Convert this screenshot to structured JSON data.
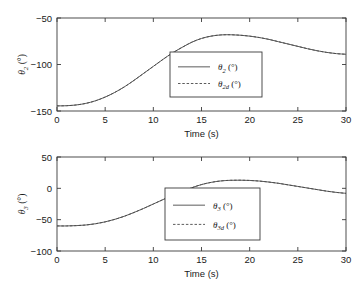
{
  "figure": {
    "background": "#ffffff",
    "line_color": "#4a4a4a",
    "axis_color": "#3a3a3a"
  },
  "chart_data": [
    {
      "id": "theta2-plot",
      "type": "line",
      "title": "",
      "xlabel": "Time (s)",
      "ylabel": "θ₂ (°)",
      "ylabel_base": "θ",
      "ylabel_sub": "2",
      "ylabel_unit": " (°)",
      "xlim": [
        0,
        30
      ],
      "ylim": [
        -150,
        -50
      ],
      "xticks": [
        0,
        5,
        10,
        15,
        20,
        25,
        30
      ],
      "xticklabels": [
        "0",
        "5",
        "10",
        "15",
        "20",
        "25",
        "30"
      ],
      "yticks": [
        -50,
        -100,
        -150
      ],
      "yticklabels": [
        "−50",
        "−100",
        "−150"
      ],
      "grid": false,
      "legend_position": "center",
      "x": [
        0,
        1,
        2,
        3,
        4,
        5,
        6,
        7,
        8,
        9,
        10,
        11,
        12,
        13,
        14,
        15,
        16,
        17,
        18,
        19,
        20,
        21,
        22,
        23,
        24,
        25,
        26,
        27,
        28,
        29,
        30
      ],
      "series": [
        {
          "name": "θ₂ (°)",
          "label_base": "θ",
          "label_sub": "2",
          "label_unit": " (°)",
          "style": "solid",
          "values": [
            -144.5,
            -144.3,
            -143.5,
            -141.8,
            -139.0,
            -135.0,
            -130.0,
            -124.0,
            -117.0,
            -109.5,
            -102.0,
            -94.5,
            -87.5,
            -81.5,
            -76.0,
            -72.0,
            -69.5,
            -68.2,
            -68.0,
            -68.5,
            -69.5,
            -71.0,
            -73.0,
            -75.5,
            -78.0,
            -80.5,
            -83.0,
            -85.2,
            -87.0,
            -88.3,
            -89.0
          ]
        },
        {
          "name": "θ₂ₑ (°)",
          "label_base": "θ",
          "label_sub": "2d",
          "label_unit": " (°)",
          "style": "dashed",
          "values": [
            -144.5,
            -144.3,
            -143.5,
            -141.8,
            -139.0,
            -135.0,
            -130.0,
            -124.0,
            -117.0,
            -109.5,
            -102.0,
            -94.5,
            -87.5,
            -81.5,
            -76.0,
            -72.0,
            -69.5,
            -68.2,
            -68.0,
            -68.5,
            -69.5,
            -71.0,
            -73.0,
            -75.5,
            -78.0,
            -80.5,
            -83.0,
            -85.2,
            -87.0,
            -88.3,
            -89.0
          ]
        }
      ]
    },
    {
      "id": "theta3-plot",
      "type": "line",
      "title": "",
      "xlabel": "Time (s)",
      "ylabel": "θ₃ (°)",
      "ylabel_base": "θ",
      "ylabel_sub": "3",
      "ylabel_unit": " (°)",
      "xlim": [
        0,
        30
      ],
      "ylim": [
        -100,
        50
      ],
      "xticks": [
        0,
        5,
        10,
        15,
        20,
        25,
        30
      ],
      "xticklabels": [
        "0",
        "5",
        "10",
        "15",
        "20",
        "25",
        "30"
      ],
      "yticks": [
        50,
        0,
        -50,
        -100
      ],
      "yticklabels": [
        "50",
        "0",
        "−50",
        "−100"
      ],
      "grid": false,
      "legend_position": "center",
      "x": [
        0,
        1,
        2,
        3,
        4,
        5,
        6,
        7,
        8,
        9,
        10,
        11,
        12,
        13,
        14,
        15,
        16,
        17,
        18,
        19,
        20,
        21,
        22,
        23,
        24,
        25,
        26,
        27,
        28,
        29,
        30
      ],
      "series": [
        {
          "name": "θ₃ (°)",
          "label_base": "θ",
          "label_sub": "3",
          "label_unit": " (°)",
          "style": "solid",
          "values": [
            -60.0,
            -60.0,
            -59.5,
            -58.5,
            -56.5,
            -53.5,
            -49.5,
            -44.5,
            -38.5,
            -32.0,
            -25.0,
            -18.0,
            -11.0,
            -4.5,
            1.0,
            6.0,
            9.5,
            11.8,
            12.8,
            13.0,
            12.6,
            11.6,
            10.0,
            8.0,
            5.5,
            3.0,
            0.5,
            -2.0,
            -4.5,
            -6.5,
            -8.0
          ]
        },
        {
          "name": "θ₃ₑ (°)",
          "label_base": "θ",
          "label_sub": "3d",
          "label_unit": " (°)",
          "style": "dashed",
          "values": [
            -60.0,
            -60.0,
            -59.5,
            -58.5,
            -56.5,
            -53.5,
            -49.5,
            -44.5,
            -38.5,
            -32.0,
            -25.0,
            -18.0,
            -11.0,
            -4.5,
            1.0,
            6.0,
            9.5,
            11.8,
            12.8,
            13.0,
            12.6,
            11.6,
            10.0,
            8.0,
            5.5,
            3.0,
            0.5,
            -2.0,
            -4.5,
            -6.5,
            -8.0
          ]
        }
      ]
    }
  ]
}
